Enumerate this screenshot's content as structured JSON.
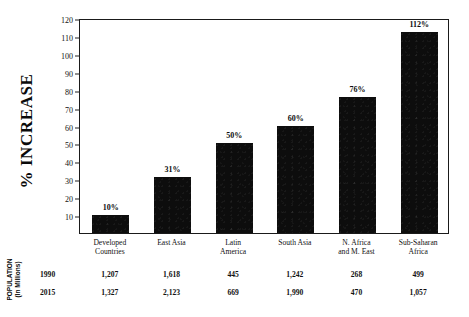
{
  "chart_data": {
    "type": "bar",
    "title": "",
    "xlabel": "",
    "ylabel": "% INCREASE",
    "ylim": [
      0,
      120
    ],
    "yticks": [
      10,
      20,
      30,
      40,
      50,
      60,
      70,
      80,
      90,
      100,
      110,
      120
    ],
    "grid": false,
    "legend": null,
    "categories": [
      "Developed\nCountries",
      "East Asia",
      "Latin\nAmerica",
      "South Asia",
      "N. Africa\nand M. East",
      "Sub-Saharan\nAfrica"
    ],
    "values": [
      10,
      31,
      50,
      60,
      76,
      112
    ],
    "data_labels": [
      "10%",
      "31%",
      "50%",
      "60%",
      "76%",
      "112%"
    ],
    "bar_color": "#0d0d0d"
  },
  "axis": {
    "y_title": "% INCREASE",
    "ticks": [
      {
        "label": "120",
        "value": 120
      },
      {
        "label": "110",
        "value": 110
      },
      {
        "label": "100",
        "value": 100
      },
      {
        "label": "90",
        "value": 90
      },
      {
        "label": "80",
        "value": 80
      },
      {
        "label": "70",
        "value": 70
      },
      {
        "label": "60",
        "value": 60
      },
      {
        "label": "50",
        "value": 50
      },
      {
        "label": "40",
        "value": 40
      },
      {
        "label": "30",
        "value": 30
      },
      {
        "label": "20",
        "value": 20
      },
      {
        "label": "10",
        "value": 10
      }
    ]
  },
  "categories": [
    {
      "line1": "Developed",
      "line2": "Countries"
    },
    {
      "line1": "East Asia",
      "line2": ""
    },
    {
      "line1": "Latin",
      "line2": "America"
    },
    {
      "line1": "South Asia",
      "line2": ""
    },
    {
      "line1": "N. Africa",
      "line2": "and M. East"
    },
    {
      "line1": "Sub-Saharan",
      "line2": "Africa"
    }
  ],
  "bars": [
    {
      "label": "10%",
      "value": 10
    },
    {
      "label": "31%",
      "value": 31
    },
    {
      "label": "50%",
      "value": 50
    },
    {
      "label": "60%",
      "value": 60
    },
    {
      "label": "76%",
      "value": 76
    },
    {
      "label": "112%",
      "value": 112
    }
  ],
  "table": {
    "title_line1": "POPULATION",
    "title_line2": "(In Millions)",
    "rows": [
      {
        "year": "1990",
        "values": [
          "1,207",
          "1,618",
          "445",
          "1,242",
          "268",
          "499"
        ]
      },
      {
        "year": "2015",
        "values": [
          "1,327",
          "2,123",
          "669",
          "1,990",
          "470",
          "1,057"
        ]
      }
    ]
  }
}
